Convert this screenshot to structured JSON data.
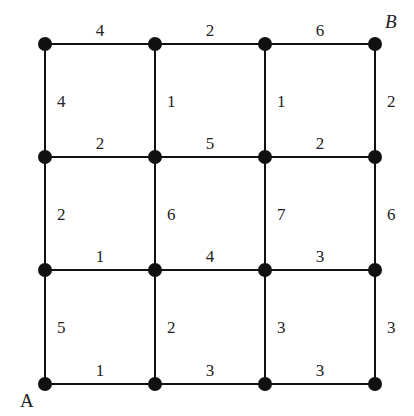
{
  "diagram": {
    "type": "weighted-grid-graph",
    "grid": {
      "cols": 4,
      "rows": 4
    },
    "node_x": [
      45,
      155,
      265,
      375
    ],
    "node_y": [
      44,
      157,
      270,
      384
    ],
    "start_label": "A",
    "end_label": "B",
    "horizontal_weights": [
      [
        "4",
        "2",
        "6"
      ],
      [
        "2",
        "5",
        "2"
      ],
      [
        "1",
        "4",
        "3"
      ],
      [
        "1",
        "3",
        "3"
      ]
    ],
    "vertical_weights": [
      [
        "4",
        "1",
        "1",
        "2"
      ],
      [
        "2",
        "6",
        "7",
        "6"
      ],
      [
        "5",
        "2",
        "3",
        "3"
      ]
    ],
    "colors": {
      "line": "#111111",
      "node": "#111111",
      "text": "#222222",
      "background": "#ffffff"
    }
  }
}
